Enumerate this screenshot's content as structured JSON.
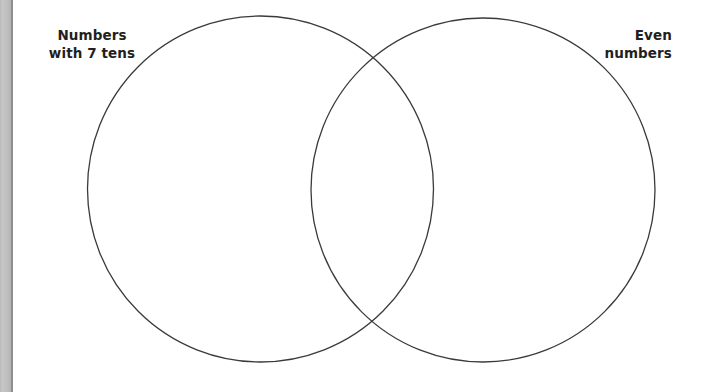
{
  "page": {
    "width": 703,
    "height": 392,
    "background_color": "#ffffff"
  },
  "gutter": {
    "name": "scanned-page-gutter",
    "color": "#c2c2c2",
    "edge_color": "#8e8e8e",
    "width_px": 11
  },
  "diagram": {
    "type": "venn",
    "stroke_color": "#3a3a3a",
    "stroke_width": 1.3,
    "fill": "none",
    "circles": [
      {
        "id": "left-circle",
        "label_key": "left",
        "cx": 260.5,
        "cy": 189,
        "r": 173
      },
      {
        "id": "right-circle",
        "label_key": "right",
        "cx": 483,
        "cy": 190,
        "r": 172
      }
    ],
    "intersection_points": [
      {
        "x": 370,
        "y": 70
      },
      {
        "x": 370,
        "y": 320
      }
    ]
  },
  "labels": {
    "left": {
      "name": "left-set-label",
      "line1": "Numbers",
      "line2": "with 7 tens",
      "color": "#231f20"
    },
    "right": {
      "name": "right-set-label",
      "line1": "Even",
      "line2": "numbers",
      "color": "#231f20"
    }
  }
}
